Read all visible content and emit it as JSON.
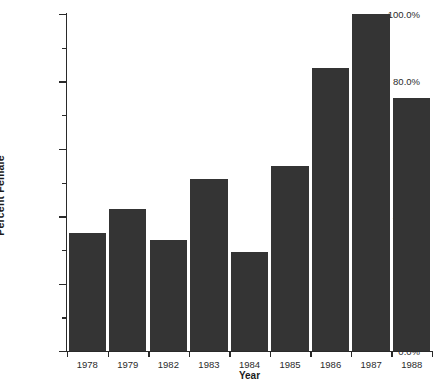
{
  "chart_data": {
    "type": "bar",
    "title": "",
    "xlabel": "Year",
    "ylabel": "Percent Female",
    "categories": [
      "1978",
      "1979",
      "1982",
      "1983",
      "1984",
      "1985",
      "1986",
      "1987",
      "1988"
    ],
    "values": [
      35.0,
      42.0,
      33.0,
      51.0,
      29.5,
      55.0,
      84.0,
      100.0,
      75.0
    ],
    "ylim": [
      0,
      100
    ],
    "ytick_values": [
      0,
      20,
      40,
      60,
      80,
      100
    ],
    "ytick_labels": [
      "0.0%",
      "20.0%",
      "40.0%",
      "60.0%",
      "80.0%",
      "100.0%"
    ],
    "yminor_tick_values": [
      10,
      30,
      50,
      70,
      90
    ],
    "grid": false,
    "legend": false,
    "bar_color": "#343434",
    "axis_color": "#2a2a2a",
    "background_color": "#ffffff"
  }
}
